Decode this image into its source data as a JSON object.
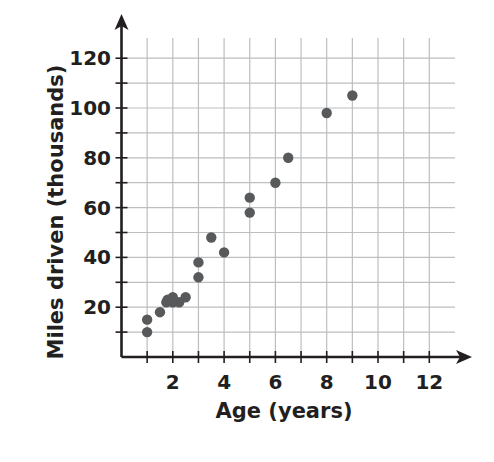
{
  "chart_data": {
    "type": "scatter",
    "title": "",
    "xlabel": "Age (years)",
    "ylabel": "Miles driven (thousands)",
    "xlim": [
      0,
      13
    ],
    "ylim": [
      0,
      130
    ],
    "x_ticks": [
      2,
      4,
      6,
      8,
      10,
      12
    ],
    "y_ticks": [
      20,
      40,
      60,
      80,
      100,
      120
    ],
    "x_minor_ticks": [
      1,
      2,
      3,
      4,
      5,
      6,
      7,
      8,
      9,
      10,
      11,
      12
    ],
    "y_minor_ticks": [
      10,
      20,
      30,
      40,
      50,
      60,
      70,
      80,
      90,
      100,
      110,
      120
    ],
    "grid": true,
    "legend": null,
    "series": [
      {
        "name": "Cars",
        "color": "#58595b",
        "points": [
          {
            "x": 1,
            "y": 15
          },
          {
            "x": 1,
            "y": 10
          },
          {
            "x": 1.5,
            "y": 18
          },
          {
            "x": 1.75,
            "y": 22
          },
          {
            "x": 1.8,
            "y": 23
          },
          {
            "x": 2,
            "y": 24
          },
          {
            "x": 2,
            "y": 22
          },
          {
            "x": 2.25,
            "y": 22
          },
          {
            "x": 2.5,
            "y": 24
          },
          {
            "x": 3,
            "y": 38
          },
          {
            "x": 3,
            "y": 32
          },
          {
            "x": 3.5,
            "y": 48
          },
          {
            "x": 4,
            "y": 42
          },
          {
            "x": 5,
            "y": 64
          },
          {
            "x": 5,
            "y": 58
          },
          {
            "x": 6,
            "y": 70
          },
          {
            "x": 6.5,
            "y": 80
          },
          {
            "x": 8,
            "y": 98
          },
          {
            "x": 9,
            "y": 105
          }
        ]
      }
    ]
  },
  "colors": {
    "axis": "#231f20",
    "grid": "#bcbec0",
    "point": "#58595b",
    "text": "#231f20"
  }
}
